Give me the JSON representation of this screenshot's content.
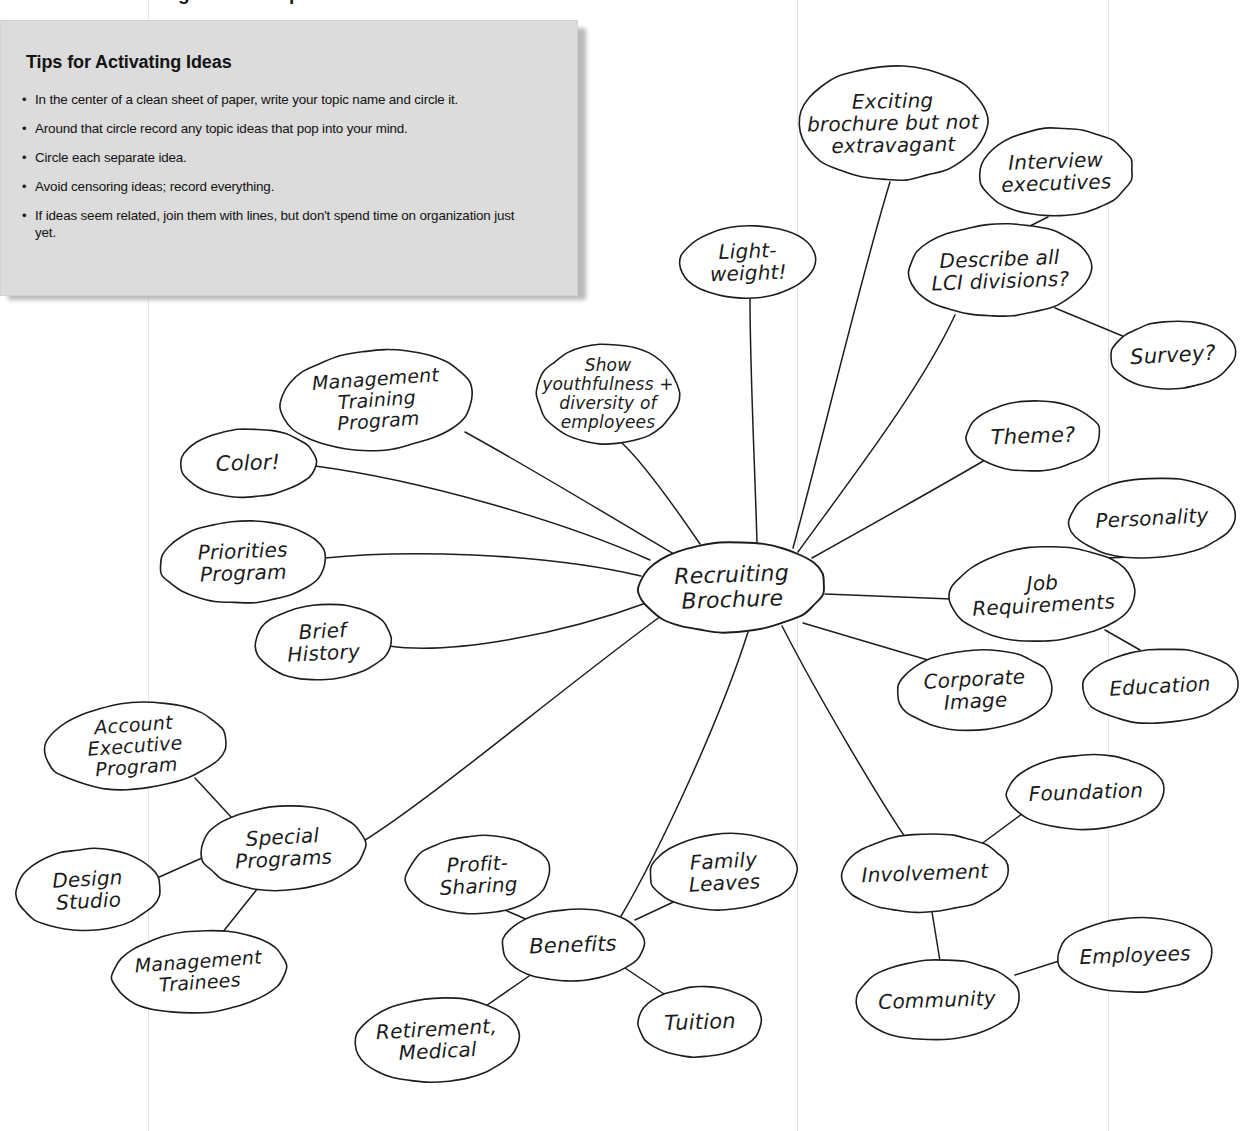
{
  "figure": {
    "caption": "FIGURE 4.2   ●  Using a Mind Map"
  },
  "tips": {
    "title": "Tips for Activating Ideas",
    "bullet": "•",
    "items": [
      "In the center of a clean sheet of paper, write your topic name and circle it.",
      "Around that circle record any topic ideas that pop into your mind.",
      "Circle each separate idea.",
      "Avoid censoring ideas; record everything.",
      "If ideas seem related, join them with lines, but don't spend time on organization just yet."
    ]
  },
  "mindmap": {
    "center_id": "recruiting-brochure",
    "nodes": [
      {
        "id": "recruiting-brochure",
        "label": "Recruiting\nBrochure",
        "cx": 732,
        "cy": 587,
        "rx": 93,
        "ry": 45,
        "fs": 22,
        "rot": -2
      },
      {
        "id": "exciting-brochure",
        "label": "Exciting\nbrochure but not\nextravagant",
        "cx": 893,
        "cy": 123,
        "rx": 95,
        "ry": 57,
        "fs": 20,
        "rot": -1
      },
      {
        "id": "interview-executives",
        "label": "Interview\nexecutives",
        "cx": 1056,
        "cy": 172,
        "rx": 77,
        "ry": 44,
        "fs": 20,
        "rot": -2
      },
      {
        "id": "describe-lci",
        "label": "Describe all\nLCI divisions?",
        "cx": 1000,
        "cy": 270,
        "rx": 92,
        "ry": 46,
        "fs": 20,
        "rot": -2
      },
      {
        "id": "survey",
        "label": "Survey?",
        "cx": 1173,
        "cy": 355,
        "rx": 62,
        "ry": 34,
        "fs": 21,
        "rot": -3
      },
      {
        "id": "light-weight",
        "label": "Light-\nweight!",
        "cx": 748,
        "cy": 262,
        "rx": 68,
        "ry": 36,
        "fs": 20,
        "rot": -2
      },
      {
        "id": "show-youthfulness",
        "label": "Show\nyouthfulness +\ndiversity of\nemployees",
        "cx": 608,
        "cy": 394,
        "rx": 71,
        "ry": 50,
        "fs": 17,
        "rot": 0
      },
      {
        "id": "management-training",
        "label": "Management\nTraining\nProgram",
        "cx": 377,
        "cy": 400,
        "rx": 96,
        "ry": 50,
        "fs": 19,
        "rot": -4
      },
      {
        "id": "color",
        "label": "Color!",
        "cx": 248,
        "cy": 463,
        "rx": 68,
        "ry": 34,
        "fs": 21,
        "rot": -2
      },
      {
        "id": "priorities-program",
        "label": "Priorities\nProgram",
        "cx": 243,
        "cy": 562,
        "rx": 83,
        "ry": 41,
        "fs": 20,
        "rot": -2
      },
      {
        "id": "brief-history",
        "label": "Brief\nHistory",
        "cx": 323,
        "cy": 642,
        "rx": 68,
        "ry": 38,
        "fs": 20,
        "rot": -3
      },
      {
        "id": "theme",
        "label": "Theme?",
        "cx": 1033,
        "cy": 436,
        "rx": 67,
        "ry": 35,
        "fs": 21,
        "rot": -2
      },
      {
        "id": "personality",
        "label": "Personality",
        "cx": 1152,
        "cy": 518,
        "rx": 83,
        "ry": 40,
        "fs": 20,
        "rot": -3
      },
      {
        "id": "job-requirements",
        "label": "Job\nRequirements",
        "cx": 1043,
        "cy": 594,
        "rx": 93,
        "ry": 47,
        "fs": 20,
        "rot": -3
      },
      {
        "id": "education",
        "label": "Education",
        "cx": 1160,
        "cy": 686,
        "rx": 78,
        "ry": 37,
        "fs": 20,
        "rot": -3
      },
      {
        "id": "corporate-image",
        "label": "Corporate\nImage",
        "cx": 975,
        "cy": 690,
        "rx": 78,
        "ry": 40,
        "fs": 20,
        "rot": -3
      },
      {
        "id": "account-executive",
        "label": "Account\nExecutive\nProgram",
        "cx": 135,
        "cy": 746,
        "rx": 91,
        "ry": 43,
        "fs": 19,
        "rot": -4
      },
      {
        "id": "special-programs",
        "label": "Special\nPrograms",
        "cx": 283,
        "cy": 848,
        "rx": 82,
        "ry": 42,
        "fs": 20,
        "rot": -3
      },
      {
        "id": "design-studio",
        "label": "Design\nStudio",
        "cx": 88,
        "cy": 890,
        "rx": 72,
        "ry": 41,
        "fs": 20,
        "rot": -3
      },
      {
        "id": "management-trainees",
        "label": "Management\nTrainees",
        "cx": 199,
        "cy": 972,
        "rx": 87,
        "ry": 41,
        "fs": 19,
        "rot": -4
      },
      {
        "id": "profit-sharing",
        "label": "Profit-\nSharing",
        "cx": 478,
        "cy": 875,
        "rx": 72,
        "ry": 39,
        "fs": 20,
        "rot": -3
      },
      {
        "id": "benefits",
        "label": "Benefits",
        "cx": 573,
        "cy": 945,
        "rx": 71,
        "ry": 36,
        "fs": 21,
        "rot": -2
      },
      {
        "id": "family-leaves",
        "label": "Family\nLeaves",
        "cx": 724,
        "cy": 872,
        "rx": 74,
        "ry": 38,
        "fs": 20,
        "rot": -3
      },
      {
        "id": "retirement-medical",
        "label": "Retirement,\nMedical",
        "cx": 437,
        "cy": 1040,
        "rx": 82,
        "ry": 42,
        "fs": 20,
        "rot": -3
      },
      {
        "id": "tuition",
        "label": "Tuition",
        "cx": 700,
        "cy": 1022,
        "rx": 62,
        "ry": 35,
        "fs": 21,
        "rot": -2
      },
      {
        "id": "involvement",
        "label": "Involvement",
        "cx": 925,
        "cy": 873,
        "rx": 83,
        "ry": 39,
        "fs": 20,
        "rot": -2
      },
      {
        "id": "foundation",
        "label": "Foundation",
        "cx": 1086,
        "cy": 792,
        "rx": 79,
        "ry": 37,
        "fs": 20,
        "rot": -2
      },
      {
        "id": "community",
        "label": "Community",
        "cx": 937,
        "cy": 1000,
        "rx": 82,
        "ry": 40,
        "fs": 20,
        "rot": -2
      },
      {
        "id": "employees",
        "label": "Employees",
        "cx": 1135,
        "cy": 955,
        "rx": 78,
        "ry": 37,
        "fs": 20,
        "rot": -2
      }
    ],
    "edges": [
      {
        "from": "recruiting-brochure",
        "to": "exciting-brochure",
        "d": "M 793 548 C 820 450 860 280 890 182"
      },
      {
        "from": "recruiting-brochure",
        "to": "light-weight",
        "d": "M 757 543 C 755 470 750 370 750 299"
      },
      {
        "from": "recruiting-brochure",
        "to": "describe-lci",
        "d": "M 798 552 C 850 480 920 390 955 315"
      },
      {
        "from": "describe-lci",
        "to": "interview-executives",
        "d": "M 1030 226 L 1048 217"
      },
      {
        "from": "describe-lci",
        "to": "survey",
        "d": "M 1055 308 L 1125 337"
      },
      {
        "from": "recruiting-brochure",
        "to": "theme",
        "d": "M 812 558 C 880 520 960 475 990 457"
      },
      {
        "from": "recruiting-brochure",
        "to": "job-requirements",
        "d": "M 825 594 L 951 599"
      },
      {
        "from": "job-requirements",
        "to": "personality",
        "d": "M 1106 558 L 1131 557"
      },
      {
        "from": "job-requirements",
        "to": "education",
        "d": "M 1105 630 L 1140 650"
      },
      {
        "from": "recruiting-brochure",
        "to": "corporate-image",
        "d": "M 803 623 L 938 663"
      },
      {
        "from": "recruiting-brochure",
        "to": "involvement",
        "d": "M 782 626 C 820 700 880 800 905 837"
      },
      {
        "from": "involvement",
        "to": "foundation",
        "d": "M 976 848 L 1030 808"
      },
      {
        "from": "involvement",
        "to": "community",
        "d": "M 932 912 L 940 961"
      },
      {
        "from": "community",
        "to": "employees",
        "d": "M 1015 975 L 1059 961"
      },
      {
        "from": "recruiting-brochure",
        "to": "benefits",
        "d": "M 748 632 C 720 720 660 850 620 918"
      },
      {
        "from": "benefits",
        "to": "profit-sharing",
        "d": "M 528 920 L 500 908"
      },
      {
        "from": "benefits",
        "to": "family-leaves",
        "d": "M 635 920 L 682 898"
      },
      {
        "from": "benefits",
        "to": "retirement-medical",
        "d": "M 535 972 L 480 1010"
      },
      {
        "from": "benefits",
        "to": "tuition",
        "d": "M 625 968 L 670 998"
      },
      {
        "from": "recruiting-brochure",
        "to": "special-programs",
        "d": "M 661 616 C 560 690 430 800 362 842"
      },
      {
        "from": "special-programs",
        "to": "account-executive",
        "d": "M 232 818 L 195 778"
      },
      {
        "from": "special-programs",
        "to": "design-studio",
        "d": "M 202 858 L 157 878"
      },
      {
        "from": "special-programs",
        "to": "management-trainees",
        "d": "M 258 888 L 222 933"
      },
      {
        "from": "recruiting-brochure",
        "to": "brief-history",
        "d": "M 649 602 C 560 635 450 655 389 646"
      },
      {
        "from": "recruiting-brochure",
        "to": "priorities-program",
        "d": "M 641 576 C 540 552 400 550 325 558"
      },
      {
        "from": "recruiting-brochure",
        "to": "color",
        "d": "M 650 560 C 560 520 420 480 315 466"
      },
      {
        "from": "recruiting-brochure",
        "to": "management-training",
        "d": "M 677 556 C 600 510 520 462 465 432"
      },
      {
        "from": "recruiting-brochure",
        "to": "show-youthfulness",
        "d": "M 700 544 C 670 500 640 460 622 443"
      }
    ]
  }
}
